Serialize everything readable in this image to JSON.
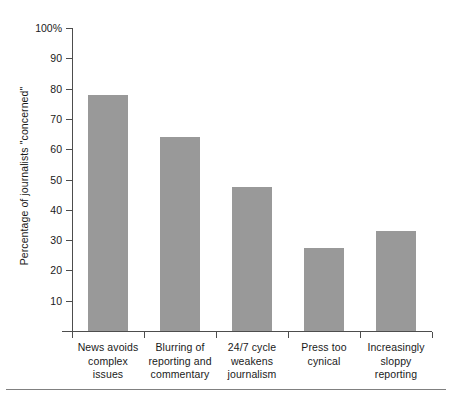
{
  "chart_data": {
    "type": "bar",
    "title": "",
    "xlabel": "",
    "ylabel": "Percentage of journalists \"concerned\"",
    "ylim": [
      0,
      100
    ],
    "grid": false,
    "legend": "none",
    "orientation": "vertical",
    "bar_color": "#999999",
    "axis_color": "#4d4d4d",
    "categories": [
      "News avoids\ncomplex issues",
      "Blurring of\nreporting and\ncommentary",
      "24/7 cycle\nweakens\njournalism",
      "Press too\ncynical",
      "Increasingly\nsloppy reporting"
    ],
    "values": [
      78,
      64,
      47.5,
      27.5,
      33
    ],
    "y_ticks": [
      10,
      20,
      30,
      40,
      50,
      60,
      70,
      80,
      90,
      100
    ],
    "y_tick_labels": [
      "10",
      "20",
      "30",
      "40",
      "50",
      "60",
      "70",
      "80",
      "90",
      "100%"
    ]
  }
}
